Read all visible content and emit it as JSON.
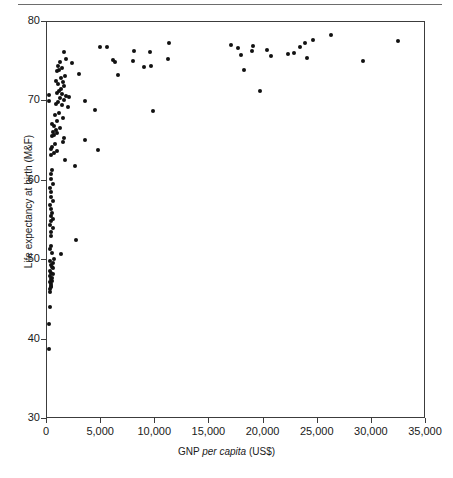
{
  "figure": {
    "top_rule": true,
    "marker_color": "#111111",
    "axis_color": "#3c3c3c",
    "background": "#ffffff"
  },
  "axis_titles": {
    "y": "Life expectancy at birth (M&F)",
    "x_pre": "GNP ",
    "x_italic": "per capita",
    "x_post": " (US$)"
  },
  "chart_data": {
    "type": "scatter",
    "title": "",
    "xlabel": "GNP per capita (US$)",
    "ylabel": "Life expectancy at birth (M&F)",
    "xlim": [
      0,
      35000
    ],
    "ylim": [
      30,
      80
    ],
    "grid": false,
    "legend": null,
    "xticks": [
      0,
      5000,
      10000,
      15000,
      20000,
      25000,
      30000,
      35000
    ],
    "xticklabels": [
      "0",
      "5,000",
      "10,000",
      "15,000",
      "20,000",
      "25,000",
      "30,000",
      "35,000"
    ],
    "yticks": [
      30,
      40,
      50,
      60,
      70,
      80
    ],
    "yticklabels": [
      "30",
      "40",
      "50",
      "60",
      "70",
      "80"
    ],
    "marker": "filled-circle",
    "marker_size_px": 4,
    "series": [
      {
        "name": "countries",
        "points": [
          [
            180,
            38.8
          ],
          [
            210,
            42.0
          ],
          [
            240,
            44.1
          ],
          [
            250,
            46.0
          ],
          [
            300,
            46.4
          ],
          [
            330,
            46.6
          ],
          [
            360,
            46.8
          ],
          [
            390,
            47.0
          ],
          [
            300,
            47.3
          ],
          [
            420,
            47.4
          ],
          [
            350,
            47.6
          ],
          [
            470,
            47.8
          ],
          [
            280,
            48.0
          ],
          [
            520,
            48.2
          ],
          [
            380,
            48.4
          ],
          [
            300,
            48.7
          ],
          [
            600,
            49.0
          ],
          [
            430,
            49.2
          ],
          [
            350,
            49.4
          ],
          [
            520,
            49.6
          ],
          [
            280,
            49.9
          ],
          [
            640,
            50.2
          ],
          [
            1300,
            50.8
          ],
          [
            420,
            50.9
          ],
          [
            300,
            51.4
          ],
          [
            350,
            51.8
          ],
          [
            2700,
            52.6
          ],
          [
            330,
            53.0
          ],
          [
            400,
            53.6
          ],
          [
            520,
            54.0
          ],
          [
            300,
            54.4
          ],
          [
            380,
            54.9
          ],
          [
            600,
            55.2
          ],
          [
            330,
            55.6
          ],
          [
            450,
            56.0
          ],
          [
            350,
            56.5
          ],
          [
            300,
            57.0
          ],
          [
            520,
            57.4
          ],
          [
            400,
            58.0
          ],
          [
            340,
            58.6
          ],
          [
            300,
            59.1
          ],
          [
            560,
            59.6
          ],
          [
            380,
            60.2
          ],
          [
            330,
            60.8
          ],
          [
            450,
            61.3
          ],
          [
            2600,
            61.9
          ],
          [
            1700,
            62.6
          ],
          [
            4700,
            63.9
          ],
          [
            400,
            63.2
          ],
          [
            620,
            63.5
          ],
          [
            900,
            63.8
          ],
          [
            350,
            64.0
          ],
          [
            500,
            64.3
          ],
          [
            750,
            64.6
          ],
          [
            1500,
            64.9
          ],
          [
            3500,
            65.2
          ],
          [
            1600,
            65.4
          ],
          [
            430,
            65.6
          ],
          [
            680,
            65.8
          ],
          [
            950,
            66.0
          ],
          [
            540,
            66.2
          ],
          [
            800,
            66.4
          ],
          [
            1200,
            66.6
          ],
          [
            620,
            66.9
          ],
          [
            430,
            67.2
          ],
          [
            900,
            67.5
          ],
          [
            1500,
            67.9
          ],
          [
            700,
            68.3
          ],
          [
            1100,
            68.6
          ],
          [
            4400,
            68.9
          ],
          [
            9800,
            68.8
          ],
          [
            1900,
            69.3
          ],
          [
            1400,
            69.5
          ],
          [
            800,
            69.7
          ],
          [
            1000,
            69.9
          ],
          [
            180,
            70.0
          ],
          [
            200,
            70.8
          ],
          [
            3500,
            70.0
          ],
          [
            1550,
            70.2
          ],
          [
            1200,
            70.4
          ],
          [
            2000,
            70.5
          ],
          [
            1750,
            70.7
          ],
          [
            1400,
            70.9
          ],
          [
            900,
            71.1
          ],
          [
            1100,
            71.3
          ],
          [
            19700,
            71.3
          ],
          [
            1300,
            71.6
          ],
          [
            1600,
            71.9
          ],
          [
            1000,
            72.2
          ],
          [
            1450,
            72.4
          ],
          [
            850,
            72.6
          ],
          [
            1250,
            72.9
          ],
          [
            1700,
            73.2
          ],
          [
            6600,
            73.3
          ],
          [
            3000,
            73.5
          ],
          [
            900,
            73.8
          ],
          [
            1100,
            74.0
          ],
          [
            18200,
            74.0
          ],
          [
            1400,
            74.2
          ],
          [
            9000,
            74.3
          ],
          [
            9600,
            74.4
          ],
          [
            1000,
            74.5
          ],
          [
            2300,
            74.8
          ],
          [
            6300,
            74.9
          ],
          [
            1200,
            75.0
          ],
          [
            29200,
            75.1
          ],
          [
            6100,
            75.2
          ],
          [
            1750,
            75.4
          ],
          [
            11200,
            75.4
          ],
          [
            24000,
            75.5
          ],
          [
            20700,
            75.7
          ],
          [
            17900,
            75.9
          ],
          [
            22300,
            76.0
          ],
          [
            1600,
            76.2
          ],
          [
            22800,
            76.1
          ],
          [
            9500,
            76.2
          ],
          [
            8000,
            76.3
          ],
          [
            18900,
            76.4
          ],
          [
            20300,
            76.5
          ],
          [
            17600,
            76.7
          ],
          [
            23400,
            76.8
          ],
          [
            5500,
            76.9
          ],
          [
            19000,
            77.0
          ],
          [
            17000,
            77.1
          ],
          [
            23800,
            77.3
          ],
          [
            11300,
            77.4
          ],
          [
            32400,
            77.6
          ],
          [
            24600,
            77.7
          ],
          [
            26200,
            78.4
          ],
          [
            4900,
            76.8
          ],
          [
            7900,
            75.1
          ]
        ]
      }
    ]
  }
}
